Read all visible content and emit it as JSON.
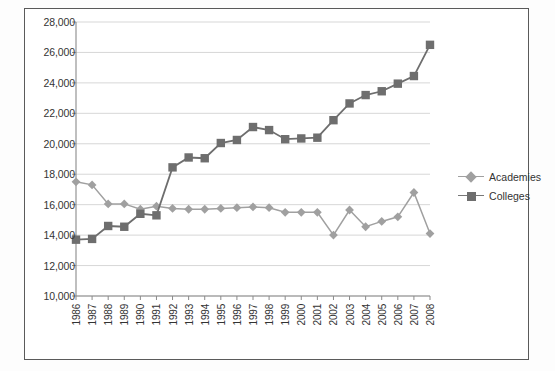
{
  "chart_data": {
    "type": "line",
    "title": "",
    "xlabel": "",
    "ylabel": "",
    "ylim": [
      10000,
      28000
    ],
    "ytick_step": 2000,
    "grid": true,
    "legend_position": "right",
    "categories": [
      "1986",
      "1987",
      "1988",
      "1989",
      "1990",
      "1991",
      "1992",
      "1993",
      "1994",
      "1995",
      "1996",
      "1997",
      "1998",
      "1999",
      "2000",
      "2001",
      "2002",
      "2003",
      "2004",
      "2005",
      "2006",
      "2007",
      "2008"
    ],
    "yticks": [
      "10,000",
      "12,000",
      "14,000",
      "16,000",
      "18,000",
      "20,000",
      "22,000",
      "24,000",
      "26,000",
      "28,000"
    ],
    "series": [
      {
        "name": "Academies",
        "marker": "diamond",
        "color": "#a0a0a0",
        "values": [
          17500,
          17300,
          16050,
          16050,
          15700,
          15900,
          15750,
          15700,
          15700,
          15750,
          15800,
          15850,
          15800,
          15500,
          15500,
          15500,
          14000,
          15650,
          14550,
          14900,
          15200,
          16800,
          14100
        ]
      },
      {
        "name": "Colleges",
        "marker": "square",
        "color": "#6e6e6e",
        "values": [
          13700,
          13750,
          14600,
          14550,
          15400,
          15300,
          18450,
          19100,
          19050,
          20050,
          20250,
          21100,
          20900,
          20300,
          20350,
          20400,
          21550,
          22650,
          23200,
          23450,
          23950,
          24450,
          26500
        ]
      }
    ]
  },
  "legend": {
    "items": [
      {
        "label": "Academies"
      },
      {
        "label": "Colleges"
      }
    ]
  }
}
